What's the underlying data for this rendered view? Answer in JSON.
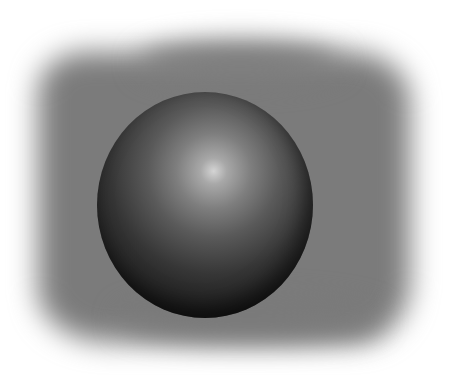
{
  "scene": {
    "description": "Rendered dark glossy sphere centered on a soft blurred gray square backdrop",
    "background_color": "#ffffff",
    "backdrop": {
      "shape": "rounded-square",
      "color": "#7b7b7b",
      "edge": "soft-blur"
    },
    "sphere": {
      "color_edge": "#0a0a0a",
      "color_highlight": "#d4d4d4",
      "highlight_position": "upper-center-right"
    }
  }
}
